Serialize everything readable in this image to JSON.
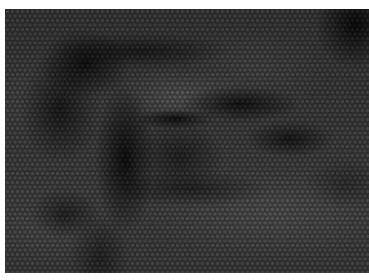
{
  "image": {
    "subject": "close-up of a human eye with brow and eyelid",
    "style": "grayscale hexagonal dot halftone mosaic",
    "frame": {
      "left": 5,
      "top": 9,
      "width": 364,
      "height": 264,
      "margin_color": "#ffffff"
    },
    "palette": {
      "darkest": "#0a0a0a",
      "shadow": "#2a2a2a",
      "mid": "#8e8e8e",
      "light": "#c8c8c8",
      "highlight": "#e1e1e1"
    },
    "dot_pitch_px": 5
  }
}
